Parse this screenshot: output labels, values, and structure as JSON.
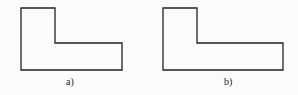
{
  "figures": [
    {
      "label": "a)",
      "shape": "L-shape",
      "points": "21,8 55,8 55,43 122,43 122,70 21,70"
    },
    {
      "label": "b)",
      "shape": "L-shape",
      "points": "163,8 197,8 197,43 283,43 283,70 163,70"
    }
  ],
  "colors": {
    "stroke": "#222222",
    "background": "#fbfbfb"
  }
}
